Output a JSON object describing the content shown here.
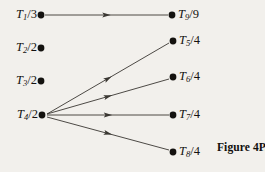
{
  "figure": {
    "caption": "Figure 4P.1",
    "caption_x": 217,
    "caption_y": 147,
    "background_color": "#f2f0ec",
    "ink_color": "#14120f",
    "edge_color": "#3a3732"
  },
  "nodes": [
    {
      "id": "T1",
      "symbol": "T",
      "subscript": "1",
      "separator": "/",
      "denominator": "3",
      "text": "T1/3",
      "x": 41,
      "y": 15,
      "label_side": "left",
      "label_x": 37,
      "label_y": 15
    },
    {
      "id": "T2",
      "symbol": "T",
      "subscript": "2",
      "separator": "/",
      "denominator": "2",
      "text": "T2/2",
      "x": 41,
      "y": 48,
      "label_side": "left",
      "label_x": 37,
      "label_y": 48
    },
    {
      "id": "T3",
      "symbol": "T",
      "subscript": "3",
      "separator": "/",
      "denominator": "2",
      "text": "T3/2",
      "x": 41,
      "y": 81,
      "label_side": "left",
      "label_x": 37,
      "label_y": 81
    },
    {
      "id": "T4",
      "symbol": "T",
      "subscript": "4",
      "separator": "/",
      "denominator": "2",
      "text": "T4/2",
      "x": 42,
      "y": 115,
      "label_side": "left",
      "label_x": 38,
      "label_y": 115
    },
    {
      "id": "T9",
      "symbol": "T",
      "subscript": "9",
      "separator": "/",
      "denominator": "9",
      "text": "T9/9",
      "x": 172,
      "y": 15,
      "label_side": "right",
      "label_x": 178,
      "label_y": 15
    },
    {
      "id": "T5",
      "symbol": "T",
      "subscript": "5",
      "separator": "/",
      "denominator": "4",
      "text": "T5/4",
      "x": 173,
      "y": 41,
      "label_side": "right",
      "label_x": 179,
      "label_y": 41
    },
    {
      "id": "T6",
      "symbol": "T",
      "subscript": "6",
      "separator": "/",
      "denominator": "4",
      "text": "T6/4",
      "x": 173,
      "y": 77,
      "label_side": "right",
      "label_x": 179,
      "label_y": 77
    },
    {
      "id": "T7",
      "symbol": "T",
      "subscript": "7",
      "separator": "/",
      "denominator": "4",
      "text": "T7/4",
      "x": 173,
      "y": 115,
      "label_side": "right",
      "label_x": 179,
      "label_y": 115
    },
    {
      "id": "T8",
      "symbol": "T",
      "subscript": "8",
      "separator": "/",
      "denominator": "4",
      "text": "T8/4",
      "x": 173,
      "y": 152,
      "label_side": "right",
      "label_x": 179,
      "label_y": 152
    }
  ],
  "edges": [
    {
      "id": "edge-T1-T9",
      "from": "T1",
      "to": "T9",
      "x1": 45,
      "y1": 15,
      "x2": 168,
      "y2": 15,
      "arrow_t": 0.5,
      "directed": true
    },
    {
      "id": "edge-T4-T5",
      "from": "T4",
      "to": "T5",
      "x1": 47,
      "y1": 114,
      "x2": 169,
      "y2": 43,
      "arrow_t": 0.5,
      "directed": true
    },
    {
      "id": "edge-T4-T6",
      "from": "T4",
      "to": "T6",
      "x1": 47,
      "y1": 114,
      "x2": 169,
      "y2": 79,
      "arrow_t": 0.5,
      "directed": true
    },
    {
      "id": "edge-T4-T7",
      "from": "T4",
      "to": "T7",
      "x1": 47,
      "y1": 115,
      "x2": 169,
      "y2": 115,
      "arrow_t": 0.5,
      "directed": true
    },
    {
      "id": "edge-T4-T8",
      "from": "T4",
      "to": "T8",
      "x1": 47,
      "y1": 117,
      "x2": 169,
      "y2": 150,
      "arrow_t": 0.5,
      "directed": true
    }
  ]
}
